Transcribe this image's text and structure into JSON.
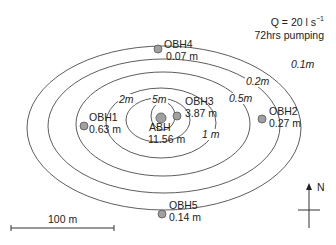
{
  "info": {
    "discharge": "Q = 20 l s",
    "discharge_exponent": "−1",
    "duration": "72hrs pumping"
  },
  "colors": {
    "line": "#333333",
    "well_fill": "#a0a0a0",
    "well_stroke": "#555555",
    "background": "#ffffff"
  },
  "contours": [
    {
      "label": "0.1m",
      "cx": 164,
      "cy": 128,
      "rx": 137,
      "ry": 82,
      "label_x": 290,
      "label_y": 64
    },
    {
      "label": "0.2m",
      "cx": 164,
      "cy": 126,
      "rx": 116,
      "ry": 67,
      "label_x": 245,
      "label_y": 81
    },
    {
      "label": "0.5m",
      "cx": 163,
      "cy": 124,
      "rx": 87,
      "ry": 52,
      "label_x": 228,
      "label_y": 98
    },
    {
      "label": "1 m",
      "cx": 161,
      "cy": 123,
      "rx": 55,
      "ry": 35,
      "label_x": 201,
      "label_y": 134
    },
    {
      "label": "2m",
      "cx": 158,
      "cy": 120,
      "rx": 32,
      "ry": 22,
      "label_x": 118,
      "label_y": 99
    },
    {
      "label": "5m",
      "cx": 163,
      "cy": 116,
      "rx": 12,
      "ry": 14,
      "label_x": 151,
      "label_y": 99
    }
  ],
  "wells": [
    {
      "id": "ABH",
      "drawdown": "11.56 m",
      "x": 161,
      "y": 118,
      "r": 5,
      "name_x": 149,
      "name_y": 127,
      "val_x": 148,
      "val_y": 139
    },
    {
      "id": "OBH3",
      "drawdown": "3.87 m",
      "x": 177,
      "y": 116,
      "r": 4,
      "name_x": 185,
      "name_y": 101,
      "val_x": 185,
      "val_y": 113
    },
    {
      "id": "OBH1",
      "drawdown": "0.63 m",
      "x": 84,
      "y": 126,
      "r": 4,
      "name_x": 89,
      "name_y": 117,
      "val_x": 89,
      "val_y": 129
    },
    {
      "id": "OBH2",
      "drawdown": "0.27 m",
      "x": 262,
      "y": 119,
      "r": 4,
      "name_x": 269,
      "name_y": 111,
      "val_x": 269,
      "val_y": 123
    },
    {
      "id": "OBH4",
      "drawdown": "0.07 m",
      "x": 158,
      "y": 49,
      "r": 4,
      "name_x": 164,
      "name_y": 44,
      "val_x": 166,
      "val_y": 56
    },
    {
      "id": "OBH5",
      "drawdown": "0.14 m",
      "x": 162,
      "y": 214,
      "r": 4,
      "name_x": 169,
      "name_y": 205,
      "val_x": 169,
      "val_y": 217
    }
  ],
  "scale_bar": {
    "label": "100 m",
    "x1": 11,
    "x2": 114,
    "y": 228
  },
  "north_arrow": {
    "label": "N",
    "x": 309,
    "y_top": 183,
    "y_bottom": 228
  }
}
